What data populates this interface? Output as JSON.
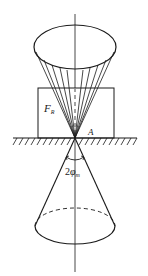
{
  "diagram": {
    "labels": {
      "force": "F",
      "force_sub": "R",
      "point": "A",
      "angle_prefix": "2",
      "angle_symbol": "φ",
      "angle_sub": "m"
    },
    "elements": {
      "upper_cone": "cone of resultant force directions with generator lines converging at A",
      "block": "rectangular block resting on ground",
      "ground": "hatched ground surface",
      "lower_cone": "friction cone with apex angle 2φm, dashed hidden rear edge of base"
    },
    "colors": {
      "stroke": "#1a1a1a",
      "background": "#ffffff"
    }
  }
}
